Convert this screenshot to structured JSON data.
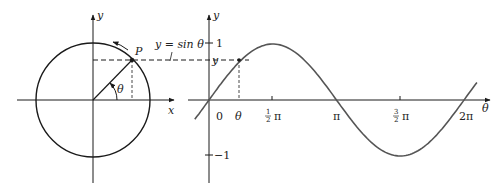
{
  "diagram": {
    "colors": {
      "stroke": "#1a1a1a",
      "curve": "#555555",
      "background": "#ffffff"
    },
    "left_panel": {
      "axis_labels": {
        "x": "x",
        "y": "y"
      },
      "point_label": "P",
      "angle_label": "θ",
      "equation_label": "y = sin θ"
    },
    "right_panel": {
      "axis_labels": {
        "horizontal": "θ",
        "vertical": "y"
      },
      "y_ticks": [
        "1",
        "−1"
      ],
      "y_value_label": "y",
      "x_ticks": {
        "zero": "0",
        "theta": "θ",
        "half_pi_num": "1",
        "half_pi_den": "2",
        "half_pi_sym": "π",
        "pi": "π",
        "three_half_num": "3",
        "three_half_den": "2",
        "three_half_sym": "π",
        "two_pi": "2π"
      }
    }
  }
}
